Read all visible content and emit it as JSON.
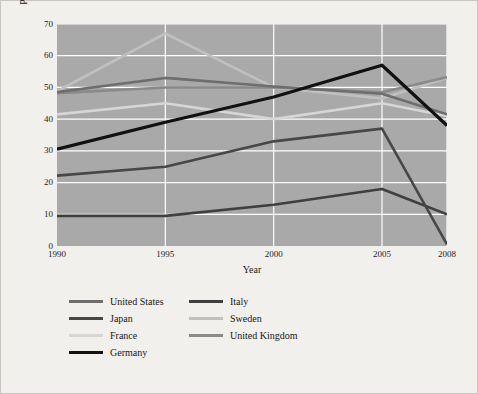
{
  "chart_data": {
    "type": "line",
    "title": "",
    "xlabel": "Year",
    "ylabel": "Percentage of marriages that end in divorce",
    "x": [
      1990,
      1995,
      2000,
      2005,
      2008
    ],
    "xticklabels": [
      "1990",
      "1995",
      "2000",
      "2005",
      "2008"
    ],
    "yticklabels": [
      "0",
      "10",
      "20",
      "30",
      "40",
      "50",
      "60",
      "70"
    ],
    "yticks": [
      0,
      10,
      20,
      30,
      40,
      50,
      60,
      70
    ],
    "ylim": [
      0,
      70
    ],
    "xlim": [
      1990,
      2008
    ],
    "grid": true,
    "grid_color": "#ffffff",
    "plot_background": "#a9a9a9",
    "figure_background": "#f2f0ec",
    "legend_position": "below-center",
    "legend_columns": 2,
    "series": [
      {
        "name": "United States",
        "color": "#6e6e6e",
        "values": [
          48.5,
          53.0,
          50.3,
          48.0,
          41.5
        ]
      },
      {
        "name": "Japan",
        "color": "#474747",
        "values": [
          22.2,
          25.0,
          33.0,
          37.0,
          0.5
        ]
      },
      {
        "name": "France",
        "color": "#d6d6d6",
        "values": [
          41.5,
          45.0,
          40.0,
          45.0,
          41.0
        ]
      },
      {
        "name": "Germany",
        "color": "#111111",
        "values": [
          30.5,
          39.0,
          47.0,
          57.0,
          38.0
        ]
      },
      {
        "name": "Italy",
        "color": "#3f3f3f",
        "values": [
          9.5,
          9.5,
          13.0,
          18.0,
          10.0
        ]
      },
      {
        "name": "Sweden",
        "color": "#c0c0c0",
        "values": [
          48.8,
          67.0,
          50.0,
          46.5,
          53.0
        ]
      },
      {
        "name": "United Kingdom",
        "color": "#8a8a8a",
        "values": [
          48.2,
          50.0,
          50.0,
          48.5,
          53.2
        ]
      }
    ]
  },
  "legend": {
    "columns": [
      {
        "items": [
          "United States",
          "Japan",
          "France",
          "Germany"
        ]
      },
      {
        "items": [
          "Italy",
          "Sweden",
          "United Kingdom"
        ]
      }
    ]
  }
}
